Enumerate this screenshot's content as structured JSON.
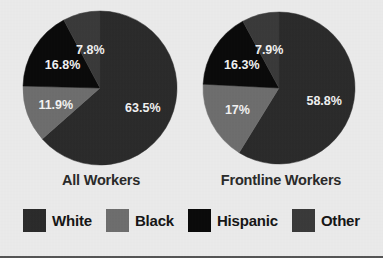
{
  "figure": {
    "background_color": "#ebebeb",
    "bottom_rule_color": "#555555"
  },
  "legend": {
    "items": [
      {
        "label": "White",
        "color": "#2b2b2b",
        "textured": false
      },
      {
        "label": "Black",
        "color": "#6e6e6e",
        "textured": false
      },
      {
        "label": "Hispanic",
        "color": "#0a0a0a",
        "textured": false
      },
      {
        "label": "Other",
        "color": "#3a3a3a",
        "textured": true
      }
    ]
  },
  "charts": {
    "all_workers": {
      "caption": "All Workers",
      "labels": [
        "63.5%",
        "11.9%",
        "16.8%",
        "7.8%"
      ]
    },
    "frontline_workers": {
      "caption": "Frontline Workers",
      "labels": [
        "58.8%",
        "17%",
        "16.3%",
        "7.9%"
      ]
    }
  },
  "chart_data": [
    {
      "type": "pie",
      "title": "All Workers",
      "categories": [
        "White",
        "Black",
        "Hispanic",
        "Other"
      ],
      "values": [
        63.5,
        11.9,
        16.8,
        7.8
      ],
      "value_labels": [
        "63.5%",
        "11.9%",
        "16.8%",
        "7.8%"
      ],
      "units": "percent",
      "colors": [
        "#2b2b2b",
        "#6e6e6e",
        "#0a0a0a",
        "#3a3a3a"
      ],
      "start_angle_deg": 0,
      "direction": "clockwise",
      "legend": true,
      "legend_position": "bottom",
      "grid": false
    },
    {
      "type": "pie",
      "title": "Frontline Workers",
      "categories": [
        "White",
        "Black",
        "Hispanic",
        "Other"
      ],
      "values": [
        58.8,
        17.0,
        16.3,
        7.9
      ],
      "value_labels": [
        "58.8%",
        "17%",
        "16.3%",
        "7.9%"
      ],
      "units": "percent",
      "colors": [
        "#2b2b2b",
        "#6e6e6e",
        "#0a0a0a",
        "#3a3a3a"
      ],
      "start_angle_deg": 0,
      "direction": "clockwise",
      "legend": true,
      "legend_position": "bottom",
      "grid": false
    }
  ]
}
